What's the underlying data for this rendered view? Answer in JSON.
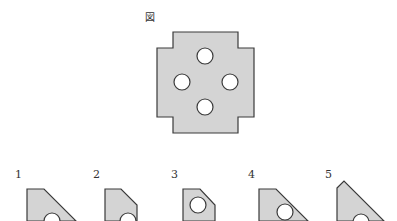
{
  "figure": {
    "label": "図",
    "shape": "cross-shaped plate with notched corners and four circular holes",
    "fill": "#d4d4d4",
    "stroke": "#3a3a3a",
    "hole_fill": "#ffffff",
    "outline_points": "173,32 238,32 238,48 254,48 254,117 238,117 238,133 173,133 173,117 157,117 157,48 173,48",
    "holes": [
      {
        "cx": 205,
        "cy": 56,
        "r": 8
      },
      {
        "cx": 182,
        "cy": 82,
        "r": 8
      },
      {
        "cx": 230,
        "cy": 82,
        "r": 8
      },
      {
        "cx": 205,
        "cy": 107,
        "r": 8
      }
    ]
  },
  "options": [
    {
      "number": "1",
      "label_x": 15,
      "label_y": 178,
      "points": "27,189 44,189 76,221 27,221",
      "hole": {
        "cx": 52,
        "cy": 221,
        "r": 8
      }
    },
    {
      "number": "2",
      "label_x": 93,
      "label_y": 178,
      "points": "105,189 121,189 137,205 137,221 105,221",
      "hole": {
        "cx": 128,
        "cy": 221,
        "r": 8
      }
    },
    {
      "number": "3",
      "label_x": 171,
      "label_y": 178,
      "points": "183,189 200,189 215,205 215,221 183,221",
      "hole": {
        "cx": 198,
        "cy": 205,
        "r": 8
      }
    },
    {
      "number": "4",
      "label_x": 248,
      "label_y": 178,
      "points": "259,189 276,189 308,221 259,221",
      "hole": {
        "cx": 285,
        "cy": 212,
        "r": 8
      }
    },
    {
      "number": "5",
      "label_x": 325,
      "label_y": 178,
      "points": "337,188 344,181 384,221 337,221",
      "hole": {
        "cx": 361,
        "cy": 222,
        "r": 8
      }
    }
  ]
}
